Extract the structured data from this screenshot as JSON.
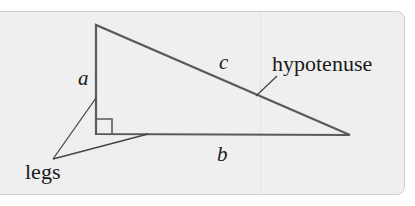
{
  "diagram": {
    "type": "right-triangle",
    "labels": {
      "side_a": "a",
      "side_b": "b",
      "side_c": "c",
      "hypotenuse": "hypotenuse",
      "legs": "legs"
    },
    "colors": {
      "background": "#efefef",
      "stroke": "#555555",
      "text": "#1a1a1a",
      "border": "#cfcfcf"
    }
  }
}
